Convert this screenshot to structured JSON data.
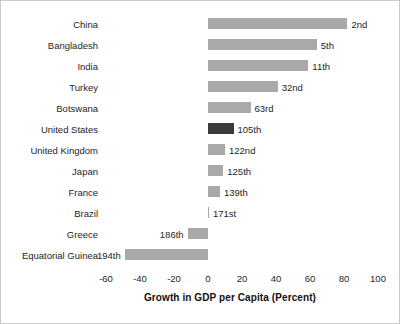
{
  "chart_data": {
    "type": "bar",
    "orientation": "horizontal",
    "title": "",
    "subtitle": "",
    "xlabel": "Growth in GDP per Capita (Percent)",
    "ylabel": "",
    "xlim": [
      -60,
      100
    ],
    "xticks": [
      -60,
      -40,
      -20,
      0,
      20,
      40,
      60,
      80,
      100
    ],
    "xtick_labels": [
      "-60",
      "-40",
      "-20",
      "0",
      "20",
      "40",
      "60",
      "80",
      "100"
    ],
    "grid": false,
    "legend": null,
    "categories": [
      "China",
      "Bangladesh",
      "India",
      "Turkey",
      "Botswana",
      "United States",
      "United Kingdom",
      "Japan",
      "France",
      "Brazil",
      "Greece",
      "Equatorial Guinea"
    ],
    "values": [
      82,
      64,
      59,
      41,
      25,
      15,
      10,
      9,
      7,
      0.5,
      -12,
      -49
    ],
    "point_labels": [
      "2nd",
      "5th",
      "11th",
      "32nd",
      "63rd",
      "105th",
      "122nd",
      "125th",
      "139th",
      "171st",
      "186th",
      "194th"
    ],
    "highlight_category": "United States",
    "colors": {
      "bar": "#a9a9a9",
      "bar_highlight": "#3b3b3b",
      "text": "#252525",
      "background": "#ffffff",
      "frame": "#c9c9c9"
    },
    "series": [
      {
        "name": "Growth in GDP per Capita (Percent)",
        "values": [
          82,
          64,
          59,
          41,
          25,
          15,
          10,
          9,
          7,
          0.5,
          -12,
          -49
        ]
      }
    ]
  }
}
